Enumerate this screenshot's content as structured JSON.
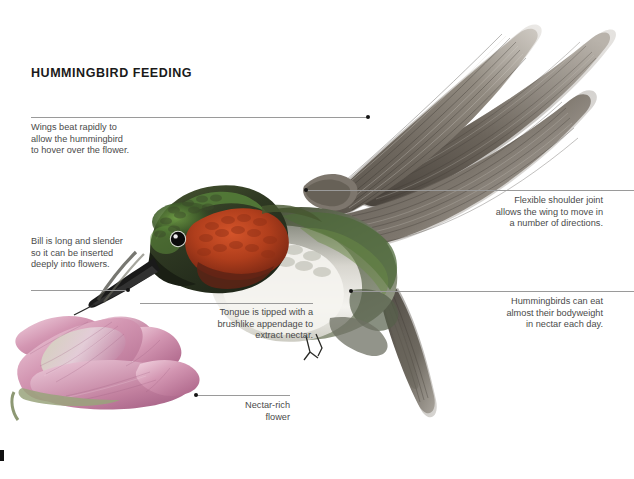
{
  "figure": {
    "title": "HUMMINGBIRD FEEDING",
    "background_color": "#ffffff",
    "leader_line_color": "#9a9a9a",
    "text_color": "#4a4a4a",
    "title_color": "#1a1a1a"
  },
  "callouts": [
    {
      "id": "wings",
      "text": "Wings beat rapidly to\nallow the hummingbird\nto hover over the flower.",
      "align": "left",
      "points_to": "wing"
    },
    {
      "id": "shoulder",
      "text": "Flexible shoulder joint\nallows the wing to move in\na number of directions.",
      "align": "right",
      "points_to": "shoulder joint"
    },
    {
      "id": "bill",
      "text": "Bill is long and slender\nso it can be inserted\ndeeply into flowers.",
      "align": "left",
      "points_to": "bill"
    },
    {
      "id": "tongue",
      "text": "Tongue is tipped with a\nbrushlike appendage to\nextract nectar.",
      "align": "right",
      "points_to": "tongue"
    },
    {
      "id": "nectar",
      "text": "Hummingbirds can eat\nalmost their bodyweight\nin nectar each day.",
      "align": "right",
      "points_to": "body"
    },
    {
      "id": "flower",
      "text": "Nectar-rich\nflower",
      "align": "right",
      "points_to": "flower"
    }
  ],
  "illustration": {
    "bird": {
      "crown_color": "#2f3a22",
      "face_color": "#232a19",
      "green_gloss_color": "#4f7a34",
      "throat_color": "#b5431f",
      "throat_shadow_color": "#7d2514",
      "breast_color": "#f2f0ec",
      "flank_color": "#b9bab0",
      "back_color": "#6e7263",
      "wing_dark_color": "#4d4740",
      "wing_light_color": "#b5aea6",
      "tail_color": "#555049",
      "bill_color": "#1b1b1b",
      "eye_color": "#0a0a0a",
      "eye_ring_color": "#efeeea"
    },
    "flower": {
      "petal_color": "#cf8fae",
      "petal_light_color": "#f0cdda",
      "petal_dark_color": "#b06a8e",
      "stem_color": "#9aa17d"
    }
  }
}
